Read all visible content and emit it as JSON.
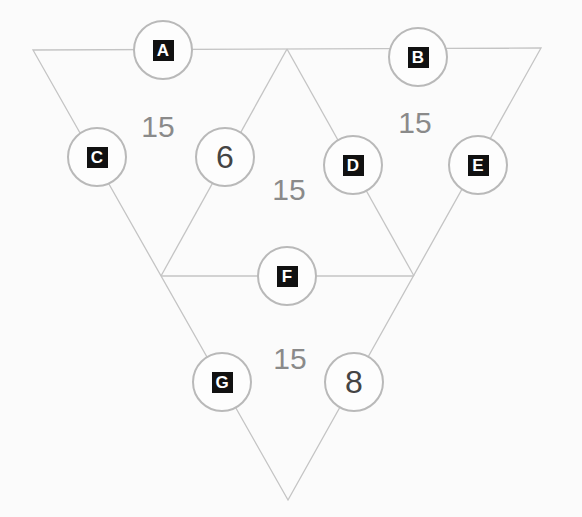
{
  "puzzle": {
    "nodes": [
      {
        "id": "A",
        "label": "A",
        "type": "unknown",
        "x": 163,
        "y": 50
      },
      {
        "id": "B",
        "label": "B",
        "type": "unknown",
        "x": 418,
        "y": 57
      },
      {
        "id": "C",
        "label": "C",
        "type": "unknown",
        "x": 97,
        "y": 157
      },
      {
        "id": "n6",
        "label": "6",
        "type": "given",
        "x": 225,
        "y": 157
      },
      {
        "id": "D",
        "label": "D",
        "type": "unknown",
        "x": 353,
        "y": 165
      },
      {
        "id": "E",
        "label": "E",
        "type": "unknown",
        "x": 478,
        "y": 165
      },
      {
        "id": "F",
        "label": "F",
        "type": "unknown",
        "x": 287,
        "y": 276
      },
      {
        "id": "G",
        "label": "G",
        "type": "unknown",
        "x": 222,
        "y": 382
      },
      {
        "id": "n8",
        "label": "8",
        "type": "given",
        "x": 354,
        "y": 382
      }
    ],
    "sums": [
      {
        "label": "15",
        "x": 158,
        "y": 127
      },
      {
        "label": "15",
        "x": 415,
        "y": 123
      },
      {
        "label": "15",
        "x": 289,
        "y": 190
      },
      {
        "label": "15",
        "x": 290,
        "y": 359
      }
    ],
    "colors": {
      "line": "#c4c4c4",
      "circle_border": "#b9b9b9",
      "letter_bg": "#111111",
      "sum_text": "#8a8a8a",
      "digit_text": "#444444"
    }
  }
}
